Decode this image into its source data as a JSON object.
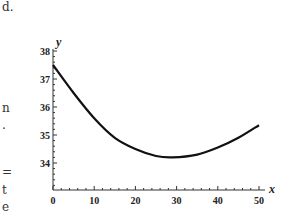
{
  "page": {
    "label": "d.",
    "margin_fragments": [
      "n",
      ".",
      "=",
      "t",
      "e"
    ]
  },
  "chart_data": {
    "type": "line",
    "title": "",
    "xlabel": "x",
    "ylabel": "y",
    "xlim": [
      0,
      50
    ],
    "ylim": [
      33,
      38
    ],
    "x_ticks": [
      0,
      10,
      20,
      30,
      40,
      50
    ],
    "y_ticks": [
      34,
      35,
      36,
      37,
      38
    ],
    "grid": false,
    "legend": null,
    "series": [
      {
        "name": "curve",
        "x": [
          0,
          5,
          10,
          15,
          20,
          25,
          29,
          35,
          40,
          45,
          50
        ],
        "values": [
          37.5,
          36.5,
          35.6,
          34.9,
          34.5,
          34.25,
          34.2,
          34.3,
          34.55,
          34.9,
          35.35
        ]
      }
    ]
  }
}
